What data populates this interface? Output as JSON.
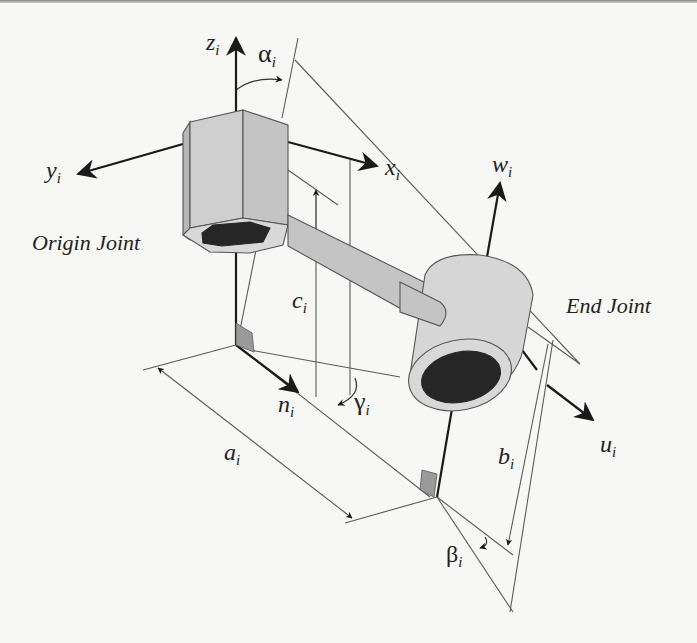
{
  "figure": {
    "colors": {
      "background": "#f7f7f5",
      "line": "#555555",
      "axis": "#1a1a1a",
      "solid_face": "#c8c8c8",
      "solid_face_light": "#d6d6d6",
      "solid_face_dark": "#b8b8b8",
      "bore": "#262626",
      "right_angle_fill": "#9a9a9a"
    }
  },
  "labels": {
    "origin_joint": "Origin Joint",
    "end_joint": "End Joint"
  },
  "axes": {
    "z": {
      "base": "z",
      "sub": "i"
    },
    "y": {
      "base": "y",
      "sub": "i"
    },
    "x": {
      "base": "x",
      "sub": "i"
    },
    "w": {
      "base": "w",
      "sub": "i"
    },
    "u": {
      "base": "u",
      "sub": "i"
    },
    "n": {
      "base": "n",
      "sub": "i"
    }
  },
  "angles": {
    "alpha": {
      "base": "α",
      "sub": "i"
    },
    "beta": {
      "base": "β",
      "sub": "i"
    },
    "gamma": {
      "base": "γ",
      "sub": "i"
    }
  },
  "dimensions": {
    "a": {
      "base": "a",
      "sub": "i"
    },
    "b": {
      "base": "b",
      "sub": "i"
    },
    "c": {
      "base": "c",
      "sub": "i"
    }
  }
}
